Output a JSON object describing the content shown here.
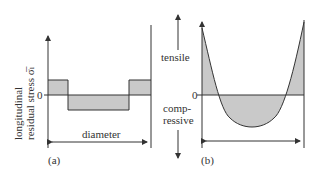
{
  "panel_a": {
    "y_axis_label_line1": "longitudinal",
    "y_axis_label_line2": "residual stress σ̅ₗ",
    "zero_label": "0",
    "x_label": "diameter",
    "caption": "(a)"
  },
  "panel_b": {
    "upper_label": "tensile",
    "lower_label_line1": "comp-",
    "lower_label_line2": "ressive",
    "zero_label": "0",
    "caption": "(b)"
  },
  "colors": {
    "fill": "#c9c9c9",
    "line": "#333333"
  }
}
